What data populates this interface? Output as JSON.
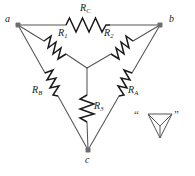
{
  "figure": {
    "background_color": "#ffffff",
    "wire_color": "#555555",
    "resistor_color": "#1a1a1a",
    "label_color": "#1a1a1a",
    "width": 195,
    "height": 176
  },
  "nodes": [
    {
      "id": "a",
      "label": "a",
      "x": 18,
      "y": 25,
      "label_x": 5,
      "label_y": 18
    },
    {
      "id": "b",
      "label": "b",
      "x": 160,
      "y": 25,
      "label_x": 168,
      "label_y": 18
    },
    {
      "id": "c",
      "label": "c",
      "x": 88,
      "y": 150,
      "label_x": 84,
      "label_y": 156
    },
    {
      "id": "center",
      "label": "",
      "x": 87,
      "y": 68,
      "label_x": 0,
      "label_y": 0
    }
  ],
  "delta_resistors": [
    {
      "id": "RC",
      "base": "R",
      "subscript": "C",
      "label_x": 80,
      "label_y": 6
    },
    {
      "id": "RB",
      "base": "R",
      "subscript": "B",
      "label_x": 33,
      "label_y": 88
    },
    {
      "id": "RA",
      "base": "R",
      "subscript": "A",
      "label_x": 127,
      "label_y": 88
    }
  ],
  "wye_resistors": [
    {
      "id": "R1",
      "base": "R",
      "subscript": "1",
      "label_x": 59,
      "label_y": 31
    },
    {
      "id": "R2",
      "base": "R",
      "subscript": "2",
      "label_x": 103,
      "label_y": 31
    },
    {
      "id": "R3",
      "base": "R",
      "subscript": "3",
      "label_x": 92,
      "label_y": 103
    }
  ],
  "symbol_annotation": {
    "name": "delta-wye-symbol",
    "open_quote": "“",
    "close_quote": "”",
    "open_quote_x": 135,
    "open_quote_y": 110,
    "close_quote_x": 173,
    "close_quote_y": 110,
    "description": "Y inside inverted triangle"
  }
}
